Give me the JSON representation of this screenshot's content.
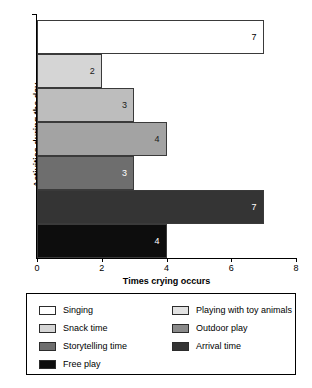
{
  "chart_data": {
    "type": "bar",
    "orientation": "horizontal",
    "title": "",
    "xlabel": "Times crying occurs",
    "ylabel": "Activities during the day",
    "xlim": [
      0,
      8
    ],
    "xticks": [
      0,
      2,
      4,
      6,
      8
    ],
    "grid": false,
    "legend_position": "bottom",
    "categories": [
      "Singing",
      "Snack time",
      "Storytelling time",
      "Free play",
      "Playing with toy animals",
      "Outdoor play",
      "Arrival time"
    ],
    "bars": [
      {
        "label": "Singing",
        "value": 7,
        "value_text": "7",
        "color": "#ffffff",
        "label_color": "#000000"
      },
      {
        "label": "Snack time",
        "value": 2,
        "value_text": "2",
        "color": "#d5d5d5",
        "label_color": "#1a1a1a"
      },
      {
        "label": "Storytelling time",
        "value": 3,
        "value_text": "3",
        "color": "#bdbdbd",
        "label_color": "#1a1a1a"
      },
      {
        "label": "Free play",
        "value": 4,
        "value_text": "4",
        "color": "#a3a3a3",
        "label_color": "#1a1a1a"
      },
      {
        "label": "Playing with toy animals",
        "value": 3,
        "value_text": "3",
        "color": "#6e6e6e",
        "label_color": "#ffffff"
      },
      {
        "label": "Outdoor play",
        "value": 7,
        "value_text": "7",
        "color": "#343434",
        "label_color": "#ffffff"
      },
      {
        "label": "Arrival time",
        "value": 4,
        "value_text": "4",
        "color": "#0d0d0d",
        "label_color": "#ffffff"
      }
    ]
  },
  "legend": {
    "left_column": [
      {
        "label": "Singing",
        "color": "#ffffff"
      },
      {
        "label": "Snack time",
        "color": "#d5d5d5"
      },
      {
        "label": "Storytelling time",
        "color": "#6e6e6e"
      },
      {
        "label": "Free play",
        "color": "#0d0d0d"
      }
    ],
    "right_column": [
      {
        "label": "Playing with toy animals",
        "color": "#e2e2e2"
      },
      {
        "label": "Outdoor play",
        "color": "#8a8a8a"
      },
      {
        "label": "Arrival time",
        "color": "#343434"
      }
    ]
  }
}
